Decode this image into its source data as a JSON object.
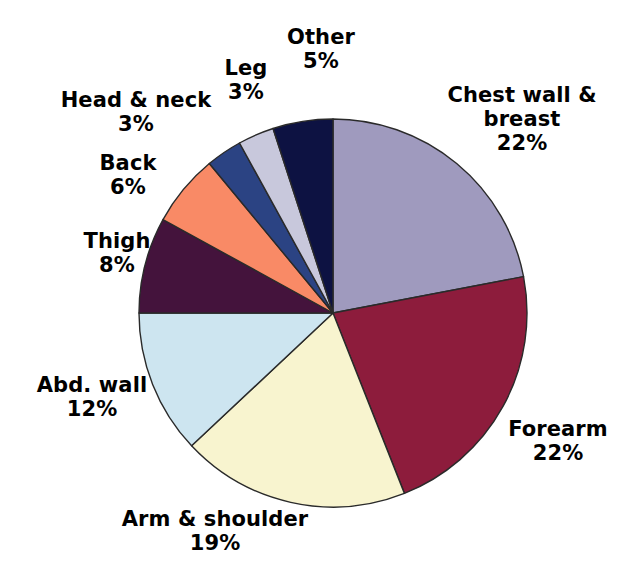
{
  "chart_data": {
    "type": "pie",
    "title": "",
    "subtitle": "",
    "xlabel": "",
    "ylabel": "",
    "unit": "%",
    "legend_position": "none",
    "grid": false,
    "start_angle_deg": 0,
    "direction": "clockwise",
    "categories": [
      "Chest wall & breast",
      "Forearm",
      "Arm & shoulder",
      "Abd. wall",
      "Thigh",
      "Back",
      "Head & neck",
      "Leg",
      "Other"
    ],
    "values": [
      22,
      22,
      19,
      12,
      8,
      6,
      3,
      3,
      5
    ],
    "value_labels": [
      "22%",
      "22%",
      "19%",
      "12%",
      "8%",
      "6%",
      "3%",
      "3%",
      "5%"
    ],
    "colors": [
      "#9f9abe",
      "#8d1c3c",
      "#f8f4cf",
      "#cde5f0",
      "#44133c",
      "#f98a66",
      "#2b4383",
      "#c8c8dc",
      "#0d1242"
    ],
    "slice_outline_color": "#2a2a2a",
    "slices": [
      {
        "label": "Chest wall & breast",
        "value": 22,
        "value_label": "22%",
        "color": "#9f9abe",
        "label_lines": [
          "Chest wall &",
          "breast"
        ]
      },
      {
        "label": "Forearm",
        "value": 22,
        "value_label": "22%",
        "color": "#8d1c3c",
        "label_lines": [
          "Forearm"
        ]
      },
      {
        "label": "Arm & shoulder",
        "value": 19,
        "value_label": "19%",
        "color": "#f8f4cf",
        "label_lines": [
          "Arm & shoulder"
        ]
      },
      {
        "label": "Abd. wall",
        "value": 12,
        "value_label": "12%",
        "color": "#cde5f0",
        "label_lines": [
          "Abd. wall"
        ]
      },
      {
        "label": "Thigh",
        "value": 8,
        "value_label": "8%",
        "color": "#44133c",
        "label_lines": [
          "Thigh"
        ]
      },
      {
        "label": "Back",
        "value": 6,
        "value_label": "6%",
        "color": "#f98a66",
        "label_lines": [
          "Back"
        ]
      },
      {
        "label": "Head & neck",
        "value": 3,
        "value_label": "3%",
        "color": "#2b4383",
        "label_lines": [
          "Head & neck"
        ]
      },
      {
        "label": "Leg",
        "value": 3,
        "value_label": "3%",
        "color": "#c8c8dc",
        "label_lines": [
          "Leg"
        ]
      },
      {
        "label": "Other",
        "value": 5,
        "value_label": "5%",
        "color": "#0d1242",
        "label_lines": [
          "Other"
        ]
      }
    ]
  },
  "geometry": {
    "center_x": 333,
    "center_y": 313,
    "radius": 194
  },
  "labels": {
    "chest_breast": {
      "line1": "Chest wall &",
      "line2": "breast",
      "value": "22%"
    },
    "forearm": {
      "name": "Forearm",
      "value": "22%"
    },
    "arm_shoulder": {
      "name": "Arm & shoulder",
      "value": "19%"
    },
    "abd_wall": {
      "name": "Abd. wall",
      "value": "12%"
    },
    "thigh": {
      "name": "Thigh",
      "value": "8%"
    },
    "back": {
      "name": "Back",
      "value": "6%"
    },
    "head_neck": {
      "name": "Head & neck",
      "value": "3%"
    },
    "leg": {
      "name": "Leg",
      "value": "3%"
    },
    "other": {
      "name": "Other",
      "value": "5%"
    }
  }
}
